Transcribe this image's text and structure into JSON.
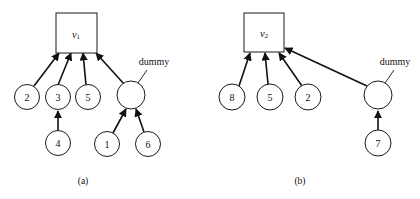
{
  "figure": {
    "background_color": "#ffffff",
    "stroke_color": "#111111",
    "panels": [
      {
        "id": "a",
        "caption": "(a)",
        "root": {
          "label": "v",
          "subscript": "1",
          "shape": "square"
        },
        "annotation": "dummy",
        "nodes": [
          {
            "label": "2"
          },
          {
            "label": "3"
          },
          {
            "label": "5"
          },
          {
            "label": "dummy-node"
          },
          {
            "label": "4"
          },
          {
            "label": "1"
          },
          {
            "label": "6"
          }
        ],
        "edges": [
          {
            "from": "2",
            "to": "v1"
          },
          {
            "from": "3",
            "to": "v1"
          },
          {
            "from": "5",
            "to": "v1"
          },
          {
            "from": "dummy",
            "to": "v1"
          },
          {
            "from": "4",
            "to": "3"
          },
          {
            "from": "1",
            "to": "dummy"
          },
          {
            "from": "6",
            "to": "dummy"
          }
        ]
      },
      {
        "id": "b",
        "caption": "(b)",
        "root": {
          "label": "v",
          "subscript": "2",
          "shape": "square"
        },
        "annotation": "dummy",
        "nodes": [
          {
            "label": "8"
          },
          {
            "label": "5"
          },
          {
            "label": "2"
          },
          {
            "label": "dummy-node"
          },
          {
            "label": "7"
          }
        ],
        "edges": [
          {
            "from": "8",
            "to": "v2"
          },
          {
            "from": "5",
            "to": "v2"
          },
          {
            "from": "2",
            "to": "v2"
          },
          {
            "from": "dummy",
            "to": "v2"
          },
          {
            "from": "7",
            "to": "dummy"
          }
        ]
      }
    ]
  },
  "panel_a": {
    "root_label": "v",
    "root_sub": "1",
    "n2": "2",
    "n3": "3",
    "n5": "5",
    "n4": "4",
    "n1": "1",
    "n6": "6",
    "dummy": "dummy",
    "caption": "(a)"
  },
  "panel_b": {
    "root_label": "v",
    "root_sub": "2",
    "n8": "8",
    "n5": "5",
    "n2": "2",
    "n7": "7",
    "dummy": "dummy",
    "caption": "(b)"
  }
}
